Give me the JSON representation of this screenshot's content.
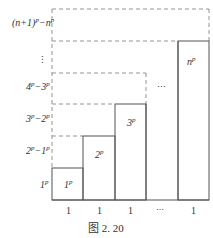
{
  "diagram": {
    "caption": "图 2. 20",
    "y_labels": [
      {
        "id": "label-1p",
        "base": "1",
        "sup": "p",
        "text": "1^p"
      },
      {
        "id": "label-2p-1p",
        "base": "2",
        "sup": "p",
        "minus": "−1",
        "sup2": "p",
        "text": "2^p−1^p"
      },
      {
        "id": "label-3p-2p",
        "base": "3",
        "sup": "p",
        "minus": "−2",
        "sup2": "p",
        "text": "3^p−2^p"
      },
      {
        "id": "label-4p-3p",
        "base": "4",
        "sup": "p",
        "minus": "−3",
        "sup2": "p",
        "text": "4^p−3^p"
      },
      {
        "id": "label-vdots",
        "text": "⋮"
      },
      {
        "id": "label-n1p-np",
        "base": "(n+1)",
        "sup": "p",
        "minus": "−n",
        "sup2": "p",
        "text": "(n+1)^p−n^p"
      }
    ],
    "bars": [
      {
        "label_base": "1",
        "label_sup": "p",
        "width_label": "1"
      },
      {
        "label_base": "2",
        "label_sup": "p",
        "width_label": "1"
      },
      {
        "label_base": "3",
        "label_sup": "p",
        "width_label": "1"
      },
      {
        "label_base": "",
        "label_sup": "",
        "width_label": "⋯"
      },
      {
        "label_base": "n",
        "label_sup": "p",
        "width_label": "1"
      }
    ],
    "middle_dots": "⋯",
    "colors": {
      "solid_line": "#555555",
      "dashed_line": "#888888",
      "text": "#333333"
    }
  }
}
